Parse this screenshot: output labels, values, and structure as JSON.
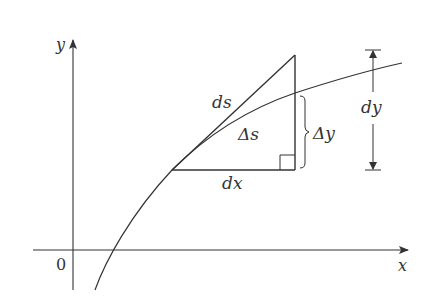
{
  "figure": {
    "type": "arc-length differential diagram",
    "colors": {
      "line": "#333333",
      "background": "#ffffff"
    },
    "axes": {
      "x_label": "x",
      "y_label": "y",
      "origin_label": "0"
    },
    "labels": {
      "ds": "ds",
      "delta_s": "Δs",
      "delta_y": "Δy",
      "dx": "dx",
      "dy": "dy"
    },
    "elements": [
      "curve y=f(x)",
      "tangent line segment (ds)",
      "horizontal run (dx)",
      "vertical rise of tangent",
      "right-angle marker",
      "brace for Δy",
      "double-headed dimension arrow for dy"
    ]
  }
}
